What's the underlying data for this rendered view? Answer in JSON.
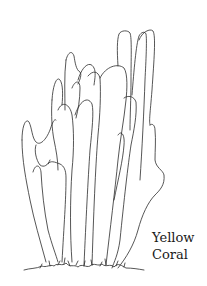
{
  "illustration": {
    "subject": "coral-line-drawing",
    "stroke_color": "#2b2b2b",
    "background_color": "#ffffff"
  },
  "caption": {
    "line1": "Yellow",
    "line2": "Coral"
  }
}
